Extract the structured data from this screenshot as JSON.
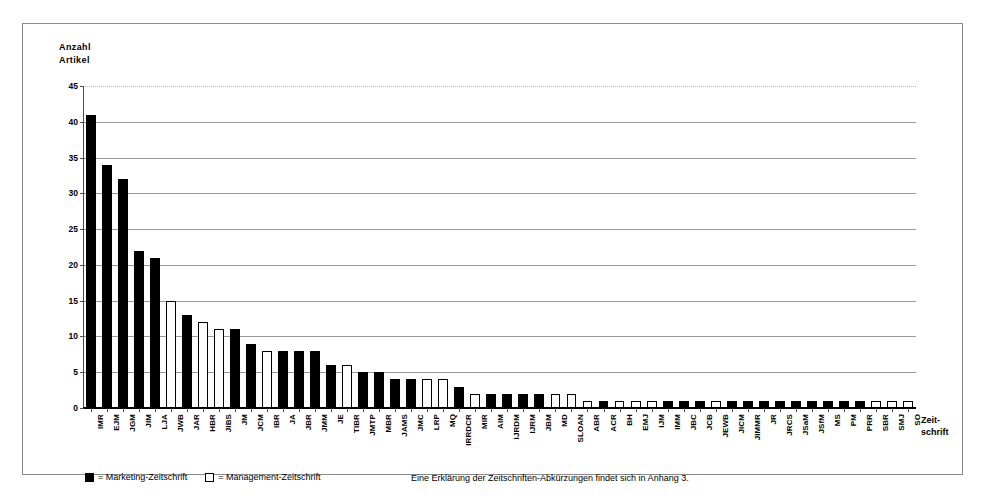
{
  "figure": {
    "y_axis_title": "Anzahl\nArtikel",
    "x_axis_title": "Zeit-\nschrift",
    "legend": {
      "items": [
        {
          "marker": "filled-square-icon",
          "label": "= Marketing-Zeitschrift"
        },
        {
          "marker": "hollow-square-icon",
          "label": "= Management-Zeitschrift"
        }
      ],
      "note": "Eine Erklärung der Zeitschriften-Abkürzungen findet sich in Anhang 3."
    },
    "colors": {
      "marketing": "#000000",
      "management": "#ffffff",
      "outline": "#000000",
      "gridline": "#9a9a9a",
      "frame": "#8a8a8a"
    }
  },
  "chart_data": {
    "type": "bar",
    "title": "",
    "xlabel": "Zeit-schrift",
    "ylabel": "Anzahl Artikel",
    "ylim": [
      0,
      45
    ],
    "ytick_values": [
      0,
      5,
      10,
      15,
      20,
      25,
      30,
      35,
      40,
      45
    ],
    "grid": true,
    "legend_position": "below-left",
    "categories": [
      "IMR",
      "EJM",
      "JGM",
      "JIM",
      "LJA",
      "JWB",
      "JAR",
      "HBR",
      "JIBS",
      "JM",
      "JCM",
      "IBR",
      "JA",
      "JBR",
      "JMM",
      "JE",
      "TIBR",
      "JMTP",
      "MBR",
      "JAMS",
      "JMC",
      "LRP",
      "MQ",
      "IRRDCR",
      "MIR",
      "AIM",
      "IJRDM",
      "IJRM",
      "JBM",
      "MD",
      "SLOAN",
      "ABR",
      "ACR",
      "BH",
      "EMJ",
      "IJM",
      "IMM",
      "JBC",
      "JCB",
      "JEWB",
      "JICM",
      "JIMMR",
      "JR",
      "JRCS",
      "JSaM",
      "JSfM",
      "MS",
      "PM",
      "PRR",
      "SBR",
      "SMJ",
      "SO"
    ],
    "values": [
      41,
      34,
      32,
      22,
      21,
      15,
      13,
      12,
      11,
      11,
      9,
      8,
      8,
      8,
      8,
      6,
      6,
      5,
      5,
      4,
      4,
      4,
      4,
      3,
      2,
      2,
      2,
      2,
      2,
      2,
      2,
      1,
      1,
      1,
      1,
      1,
      1,
      1,
      1,
      1,
      1,
      1,
      1,
      1,
      1,
      1,
      1,
      1,
      1,
      1,
      1,
      1
    ],
    "series_type": [
      "marketing",
      "marketing",
      "marketing",
      "marketing",
      "marketing",
      "management",
      "marketing",
      "management",
      "management",
      "marketing",
      "marketing",
      "management",
      "marketing",
      "marketing",
      "marketing",
      "marketing",
      "management",
      "marketing",
      "marketing",
      "marketing",
      "marketing",
      "management",
      "management",
      "marketing",
      "management",
      "marketing",
      "marketing",
      "marketing",
      "marketing",
      "management",
      "management",
      "management",
      "marketing",
      "management",
      "management",
      "management",
      "marketing",
      "marketing",
      "marketing",
      "management",
      "marketing",
      "marketing",
      "marketing",
      "marketing",
      "marketing",
      "marketing",
      "marketing",
      "marketing",
      "marketing",
      "management",
      "management",
      "management"
    ],
    "series": [
      {
        "name": "Marketing-Zeitschrift",
        "color": "#000000"
      },
      {
        "name": "Management-Zeitschrift",
        "color": "#ffffff"
      }
    ]
  }
}
